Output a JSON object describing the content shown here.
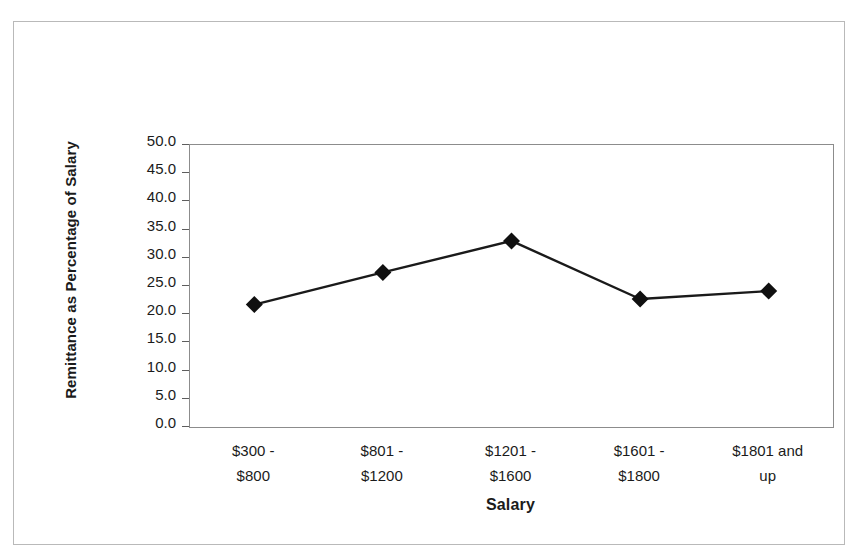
{
  "chart_data": {
    "type": "line",
    "title": "",
    "subtitle": "",
    "xlabel": "Salary",
    "ylabel": "Remittance as Percentage of Salary",
    "categories": [
      "$300 - $800",
      "$801 - $1200",
      "$1201 - $1600",
      "$1601 - $1800",
      "$1801 and up"
    ],
    "category_lines": [
      [
        "$300 -",
        "$800"
      ],
      [
        "$801 -",
        "$1200"
      ],
      [
        "$1201 -",
        "$1600"
      ],
      [
        "$1601 -",
        "$1800"
      ],
      [
        "$1801 and",
        "up"
      ]
    ],
    "values": [
      21.7,
      27.4,
      33.0,
      22.7,
      24.1
    ],
    "ylim": [
      0.0,
      50.0
    ],
    "ytick_step": 5.0,
    "ytick_labels": [
      "50.0",
      "45.0",
      "40.0",
      "35.0",
      "30.0",
      "25.0",
      "20.0",
      "15.0",
      "10.0",
      "5.0",
      "0.0"
    ],
    "grid": false,
    "legend": false,
    "legend_position": "none",
    "marker": "diamond",
    "series": [
      {
        "name": "Remittance as Percentage of Salary",
        "values": [
          21.7,
          27.4,
          33.0,
          22.7,
          24.1
        ]
      }
    ]
  },
  "colors": {
    "line": "#1a1a1a",
    "marker": "#101010",
    "axis": "#8c8c8c",
    "tick": "#5d5d5d",
    "text": "#1b1b1b",
    "frame": "#b9b9b9",
    "background": "#ffffff"
  }
}
